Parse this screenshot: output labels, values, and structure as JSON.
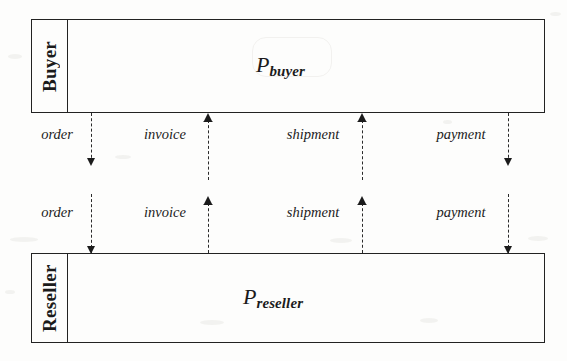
{
  "figure": {
    "type": "process-interaction-diagram",
    "background_color": "#fdfdfc",
    "ink_color": "#1b1b1b"
  },
  "boxes": [
    {
      "id": "buyer",
      "role_label": "Buyer",
      "process_symbol": "P",
      "process_subscript": "buyer",
      "x": 31,
      "y": 19,
      "width": 514,
      "height": 94,
      "label_column_width": 35
    },
    {
      "id": "reseller",
      "role_label": "Reseller",
      "process_symbol": "P",
      "process_subscript": "reseller",
      "x": 31,
      "y": 253,
      "width": 514,
      "height": 90,
      "label_column_width": 35
    }
  ],
  "channel_rows": [
    {
      "id": "upper-channels",
      "attached_to": "buyer",
      "label_y": 134,
      "channels": [
        {
          "name": "order",
          "label_x": 57,
          "line_x": 91,
          "direction": "down",
          "line_top": 113,
          "line_bottom": 163
        },
        {
          "name": "invoice",
          "label_x": 165,
          "line_x": 208,
          "direction": "up",
          "line_top": 113,
          "line_bottom": 180
        },
        {
          "name": "shipment",
          "label_x": 313,
          "line_x": 362,
          "direction": "up",
          "line_top": 113,
          "line_bottom": 180
        },
        {
          "name": "payment",
          "label_x": 461,
          "line_x": 508,
          "direction": "down",
          "line_top": 113,
          "line_bottom": 163
        }
      ]
    },
    {
      "id": "lower-channels",
      "attached_to": "reseller",
      "label_y": 212,
      "channels": [
        {
          "name": "order",
          "label_x": 57,
          "line_x": 91,
          "direction": "down",
          "line_top": 194,
          "line_bottom": 253
        },
        {
          "name": "invoice",
          "label_x": 165,
          "line_x": 208,
          "direction": "up",
          "line_top": 203,
          "line_bottom": 253
        },
        {
          "name": "shipment",
          "label_x": 313,
          "line_x": 362,
          "direction": "up",
          "line_top": 203,
          "line_bottom": 253
        },
        {
          "name": "payment",
          "label_x": 461,
          "line_x": 508,
          "direction": "down",
          "line_top": 194,
          "line_bottom": 253
        }
      ]
    }
  ],
  "arrow_semantics": {
    "order": "Buyer to Reseller",
    "invoice": "Reseller to Buyer",
    "shipment": "Reseller to Buyer",
    "payment": "Buyer to Reseller"
  }
}
